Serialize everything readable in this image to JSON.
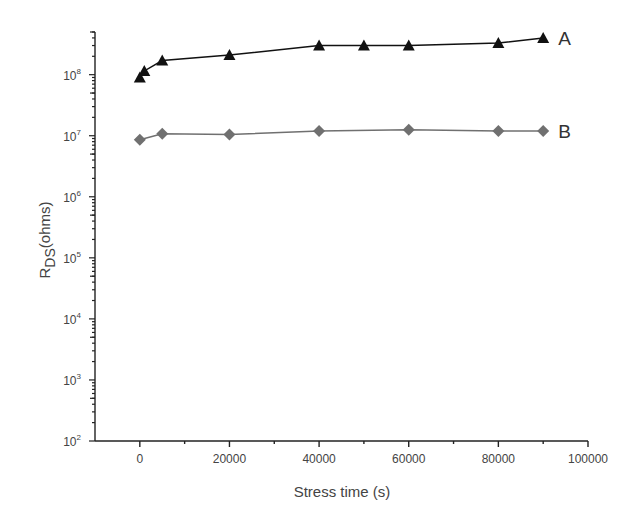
{
  "chart_data": {
    "type": "line",
    "title": "",
    "xlabel": "Stress time (s)",
    "ylabel": "R_DS(ohms)",
    "ylabel_main": "R",
    "ylabel_sub": "DS",
    "ylabel_rest": "(ohms)",
    "xscale": "linear",
    "yscale": "log",
    "xlim": [
      -10000,
      100000
    ],
    "ylim": [
      100,
      500000000
    ],
    "xticks": [
      0,
      20000,
      40000,
      60000,
      80000,
      100000
    ],
    "xtick_labels": [
      "0",
      "20000",
      "40000",
      "60000",
      "80000",
      "100000"
    ],
    "yticks_exponents": [
      2,
      3,
      4,
      5,
      6,
      7,
      8
    ],
    "ytick_base": "10",
    "grid": false,
    "legend": "inline labels at right end of each series",
    "series": [
      {
        "name": "A",
        "marker": "triangle",
        "color": "#111111",
        "x": [
          0,
          1000,
          5000,
          20000,
          40000,
          50000,
          60000,
          80000,
          90000
        ],
        "y": [
          90000000,
          115000000,
          170000000,
          210000000,
          300000000,
          300000000,
          300000000,
          330000000,
          400000000
        ]
      },
      {
        "name": "B",
        "marker": "diamond",
        "color": "#707070",
        "x": [
          0,
          5000,
          20000,
          40000,
          60000,
          80000,
          90000
        ],
        "y": [
          8600000,
          10800000,
          10500000,
          12000000,
          12500000,
          12000000,
          12000000
        ]
      }
    ]
  }
}
